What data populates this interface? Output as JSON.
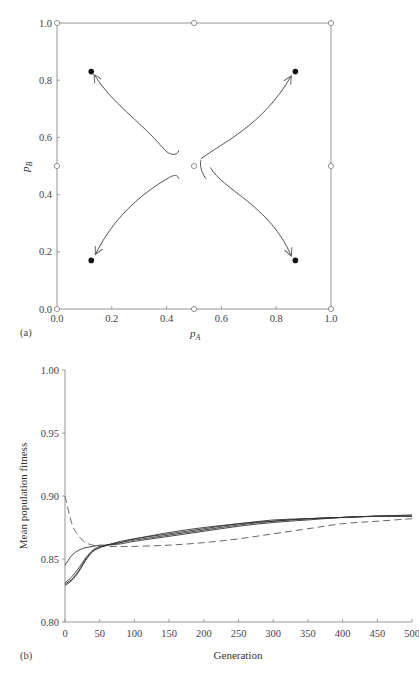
{
  "chart_data": [
    {
      "panel": "(a)",
      "type": "scatter",
      "title": "",
      "xlabel": "p_A",
      "ylabel": "p_B",
      "xlim": [
        0.0,
        1.0
      ],
      "ylim": [
        0.0,
        1.0
      ],
      "xticks": [
        "0.0",
        "0.2",
        "0.4",
        "0.6",
        "0.8",
        "1.0"
      ],
      "yticks": [
        "0.0",
        "0.2",
        "0.4",
        "0.6",
        "0.8",
        "1.0"
      ],
      "grid": false,
      "unstable_equilibria_open_circles": [
        [
          0.0,
          0.0
        ],
        [
          0.5,
          0.0
        ],
        [
          1.0,
          0.0
        ],
        [
          0.0,
          0.5
        ],
        [
          0.5,
          0.5
        ],
        [
          1.0,
          0.5
        ],
        [
          0.0,
          1.0
        ],
        [
          0.5,
          1.0
        ],
        [
          1.0,
          1.0
        ]
      ],
      "stable_equilibria_filled_circles": [
        [
          0.125,
          0.83
        ],
        [
          0.87,
          0.83
        ],
        [
          0.125,
          0.17
        ],
        [
          0.87,
          0.17
        ]
      ],
      "trajectories": [
        {
          "from": [
            0.44,
            0.55
          ],
          "to": [
            0.13,
            0.82
          ],
          "arrow": true
        },
        {
          "from": [
            0.52,
            0.52
          ],
          "to": [
            0.86,
            0.82
          ],
          "arrow": true
        },
        {
          "from": [
            0.44,
            0.46
          ],
          "to": [
            0.13,
            0.18
          ],
          "arrow": true
        },
        {
          "from": [
            0.56,
            0.49
          ],
          "to": [
            0.86,
            0.18
          ],
          "arrow": true
        },
        {
          "from": [
            0.52,
            0.52
          ],
          "to": [
            0.54,
            0.46
          ],
          "arrow": false
        }
      ]
    },
    {
      "panel": "(b)",
      "type": "line",
      "title": "",
      "xlabel": "Generation",
      "ylabel": "Mean population fitness",
      "xlim": [
        0,
        500
      ],
      "ylim": [
        0.8,
        1.0
      ],
      "xticks": [
        "0",
        "50",
        "100",
        "150",
        "200",
        "250",
        "300",
        "350",
        "400",
        "450",
        "500"
      ],
      "yticks": [
        "0.80",
        "0.85",
        "0.90",
        "0.95",
        "1.00"
      ],
      "grid": false,
      "legend": "none",
      "x": [
        0,
        10,
        20,
        30,
        40,
        50,
        60,
        80,
        100,
        150,
        200,
        250,
        300,
        350,
        400,
        450,
        500
      ],
      "series": [
        {
          "name": "dashed",
          "style": "dashed",
          "values": [
            0.9,
            0.878,
            0.868,
            0.863,
            0.861,
            0.86,
            0.86,
            0.86,
            0.86,
            0.861,
            0.863,
            0.866,
            0.87,
            0.874,
            0.878,
            0.88,
            0.882
          ]
        },
        {
          "name": "solid-1",
          "style": "solid",
          "values": [
            0.845,
            0.853,
            0.857,
            0.859,
            0.86,
            0.861,
            0.861,
            0.862,
            0.864,
            0.868,
            0.872,
            0.876,
            0.879,
            0.881,
            0.883,
            0.884,
            0.884
          ]
        },
        {
          "name": "solid-2",
          "style": "solid",
          "values": [
            0.829,
            0.833,
            0.84,
            0.849,
            0.856,
            0.859,
            0.861,
            0.863,
            0.865,
            0.869,
            0.873,
            0.877,
            0.88,
            0.882,
            0.883,
            0.884,
            0.884
          ]
        },
        {
          "name": "solid-3",
          "style": "solid",
          "values": [
            0.83,
            0.834,
            0.841,
            0.85,
            0.856,
            0.859,
            0.861,
            0.863,
            0.866,
            0.87,
            0.874,
            0.878,
            0.88,
            0.882,
            0.883,
            0.884,
            0.884
          ]
        },
        {
          "name": "solid-4",
          "style": "solid",
          "values": [
            0.831,
            0.836,
            0.843,
            0.851,
            0.857,
            0.86,
            0.861,
            0.864,
            0.866,
            0.871,
            0.875,
            0.878,
            0.881,
            0.882,
            0.883,
            0.884,
            0.885
          ]
        }
      ]
    }
  ],
  "labels": {
    "panel_a": "(a)",
    "panel_b": "(b)",
    "a_xlabel_main": "p",
    "a_xlabel_sub": "A",
    "a_ylabel_main": "p",
    "a_ylabel_sub": "B",
    "b_xlabel": "Generation",
    "b_ylabel": "Mean population fitness"
  }
}
